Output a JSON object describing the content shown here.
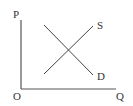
{
  "diagram": {
    "type": "supply-demand",
    "axes": {
      "y_label": "P",
      "x_label": "Q",
      "origin_label": "O"
    },
    "curves": [
      {
        "name": "S",
        "label": "S",
        "direction": "upward-sloping"
      },
      {
        "name": "D",
        "label": "D",
        "direction": "downward-sloping"
      }
    ],
    "colors": {
      "line": "#444444",
      "text": "#333333",
      "background": "#ffffff"
    }
  }
}
